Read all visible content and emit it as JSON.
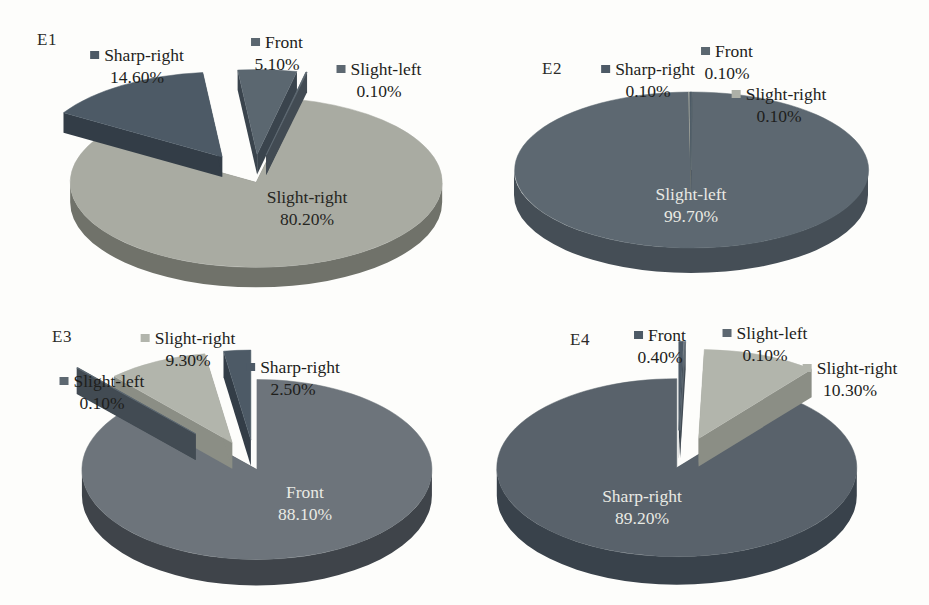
{
  "figure": {
    "background_color": "#fdfdfb",
    "description_titles": [
      "E1",
      "E2",
      "E3",
      "E4"
    ]
  },
  "chart_data": [
    {
      "type": "pie",
      "title": "E1",
      "labels": [
        "Front",
        "Slight-left",
        "Slight-right",
        "Sharp-right"
      ],
      "values": [
        5.1,
        0.1,
        80.2,
        14.6
      ],
      "value_labels": [
        "5.10%",
        "0.10%",
        "80.20%",
        "14.60%"
      ],
      "colors": [
        "#5b6770",
        "#5d6871",
        "#a9aba2",
        "#4d5a66"
      ],
      "side_colors": [
        "#3a444d",
        "#424b53",
        "#70726a",
        "#333d47"
      ],
      "label_text_colors": [
        "#1e1e1c",
        "#1e1e1c",
        "#26261f",
        "#1e1e1c"
      ],
      "style": "3d-exploded",
      "start_angle_deg": -96,
      "direction": "clockwise",
      "legend": "none"
    },
    {
      "type": "pie",
      "title": "E2",
      "labels": [
        "Front",
        "Slight-left",
        "Slight-right",
        "Sharp-right"
      ],
      "values": [
        0.1,
        99.7,
        0.1,
        0.1
      ],
      "value_labels": [
        "0.10%",
        "99.70%",
        "0.10%",
        "0.10%"
      ],
      "colors": [
        "#5b6770",
        "#5d6871",
        "#adb0a7",
        "#4d5a66"
      ],
      "side_colors": [
        "#3a444d",
        "#454e56",
        "#8b8e85",
        "#333d47"
      ],
      "label_text_colors": [
        "#1e1e1c",
        "#e9eae4",
        "#1e1e1c",
        "#1e1e1c"
      ],
      "style": "3d",
      "start_angle_deg": -90,
      "direction": "clockwise",
      "legend": "none"
    },
    {
      "type": "pie",
      "title": "E3",
      "labels": [
        "Front",
        "Slight-left",
        "Slight-right",
        "Sharp-right"
      ],
      "values": [
        88.1,
        0.1,
        9.3,
        2.5
      ],
      "value_labels": [
        "88.10%",
        "0.10%",
        "9.30%",
        "2.50%"
      ],
      "colors": [
        "#6d747b",
        "#5d6871",
        "#b2b5ac",
        "#4d5a66"
      ],
      "side_colors": [
        "#3f444a",
        "#424b53",
        "#8b8e85",
        "#333d47"
      ],
      "label_text_colors": [
        "#e9eae4",
        "#1e1e1c",
        "#1e1e1c",
        "#1e1e1c"
      ],
      "style": "3d-exploded",
      "start_angle_deg": -90,
      "direction": "clockwise",
      "legend": "none"
    },
    {
      "type": "pie",
      "title": "E4",
      "labels": [
        "Front",
        "Slight-left",
        "Slight-right",
        "Sharp-right"
      ],
      "values": [
        0.4,
        0.1,
        10.3,
        89.2
      ],
      "value_labels": [
        "0.40%",
        "0.10%",
        "10.30%",
        "89.20%"
      ],
      "colors": [
        "#4d5a66",
        "#5d6871",
        "#b2b5ac",
        "#59626b"
      ],
      "side_colors": [
        "#333d47",
        "#424b53",
        "#8b8e85",
        "#39424b"
      ],
      "label_text_colors": [
        "#1e1e1c",
        "#1e1e1c",
        "#1e1e1c",
        "#e9eae4"
      ],
      "style": "3d-exploded",
      "start_angle_deg": -90,
      "direction": "clockwise",
      "legend": "none"
    }
  ]
}
